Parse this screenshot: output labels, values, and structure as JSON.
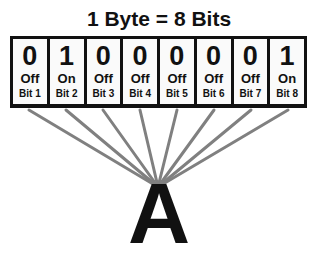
{
  "title": "1 Byte = 8 Bits",
  "bits": [
    {
      "value": "0",
      "state": "Off",
      "label": "Bit 1"
    },
    {
      "value": "1",
      "state": "On",
      "label": "Bit 2"
    },
    {
      "value": "0",
      "state": "Off",
      "label": "Bit 3"
    },
    {
      "value": "0",
      "state": "Off",
      "label": "Bit 4"
    },
    {
      "value": "0",
      "state": "Off",
      "label": "Bit 5"
    },
    {
      "value": "0",
      "state": "Off",
      "label": "Bit 6"
    },
    {
      "value": "0",
      "state": "Off",
      "label": "Bit 7"
    },
    {
      "value": "1",
      "state": "On",
      "label": "Bit 8"
    }
  ],
  "character": "A",
  "colors": {
    "lines": "#808080",
    "box": "#111111",
    "cell_fill": "#fafafa"
  }
}
